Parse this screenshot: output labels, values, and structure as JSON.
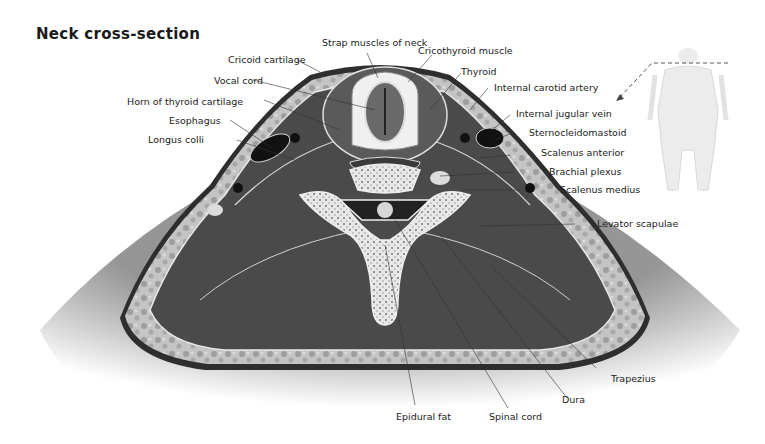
{
  "title": "Neck cross-section",
  "labels": {
    "strap_muscles": "Strap muscles of neck",
    "cricothyroid_muscle": "Cricothyroid muscle",
    "cricoid_cartilage": "Cricoid cartilage",
    "thyroid": "Thyroid",
    "vocal_cord": "Vocal cord",
    "internal_carotid_artery": "Internal carotid artery",
    "horn_of_thyroid_cartilage": "Horn of thyroid cartilage",
    "internal_jugular_vein": "Internal jugular vein",
    "esophagus": "Esophagus",
    "sternocleidomastoid": "Sternocleidomastoid",
    "longus_colli": "Longus colli",
    "scalenus_anterior": "Scalenus anterior",
    "brachial_plexus": "Brachial plexus",
    "scalenus_medius": "Scalenus medius",
    "levator_scapulae": "Levator scapulae",
    "trapezius": "Trapezius",
    "dura": "Dura",
    "epidural_fat": "Epidural fat",
    "spinal_cord": "Spinal cord"
  },
  "colors": {
    "muscle": "#4a4a4a",
    "fat": "#b8b8b8",
    "bone": "#e6e6e6",
    "skin_shadow": "#9a9a9a",
    "text": "#222222"
  },
  "locator": {
    "figure": "body-outline-icon",
    "indicator": "dashed-arrow-icon"
  }
}
